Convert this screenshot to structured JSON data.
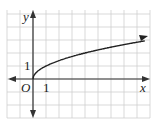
{
  "chart_data": {
    "type": "line",
    "title": "",
    "xlabel": "x",
    "ylabel": "y",
    "origin_label": "O",
    "x_tick_label": "1",
    "y_tick_label": "1",
    "function": "y = sqrt(x)",
    "grid": true,
    "xlim": [
      -2,
      9
    ],
    "ylim": [
      -3,
      5
    ],
    "series": [
      {
        "name": "y = sqrt(x)",
        "x": [
          0,
          0.25,
          1,
          2,
          4,
          6,
          8.8
        ],
        "y": [
          0,
          0.5,
          1,
          1.41,
          2,
          2.45,
          2.97
        ]
      }
    ],
    "colors": {
      "grid": "#cfcfcf",
      "axis": "#333333",
      "curve": "#222222"
    }
  }
}
